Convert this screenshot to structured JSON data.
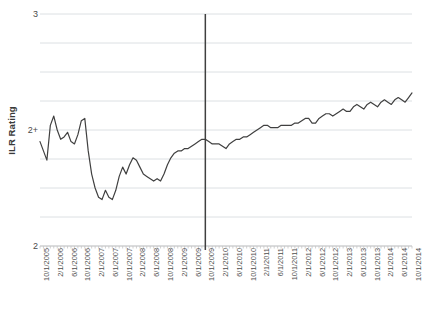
{
  "chart_data": {
    "type": "line",
    "title": "",
    "xlabel": "",
    "ylabel": "ILR Rating",
    "ylim": [
      2,
      3
    ],
    "ytick_labels": [
      "3",
      "2+",
      "2"
    ],
    "ytick_values": [
      3,
      2.6,
      2
    ],
    "gridlines": true,
    "gridline_count": 9,
    "legend": "none",
    "series_name": "ILR Rating",
    "series_color": "#404040",
    "annotations": [
      {
        "type": "vertical-line",
        "x": "10/1/2009",
        "color": "#404040",
        "label": ""
      }
    ],
    "xtick_labels": [
      "10/1/2005",
      "2/1/2006",
      "6/1/2006",
      "10/1/2006",
      "2/1/2007",
      "6/1/2007",
      "10/1/2007",
      "2/1/2008",
      "6/1/2008",
      "10/1/2008",
      "2/1/2009",
      "6/1/2009",
      "10/1/2009",
      "2/1/2010",
      "6/1/2010",
      "10/1/2010",
      "2/1/2011",
      "6/1/2011",
      "10/1/2011",
      "2/1/2012",
      "6/1/2012",
      "10/1/2012",
      "2/1/2013",
      "6/1/2013",
      "10/1/2013",
      "2/1/2014",
      "6/1/2014",
      "10/1/2014"
    ],
    "xtick_label_interval_months": 4,
    "x_start": "10/1/2005",
    "x_end": "10/1/2014",
    "x_step_months": 1,
    "x": [
      "10/1/2005",
      "11/1/2005",
      "12/1/2005",
      "1/1/2006",
      "2/1/2006",
      "3/1/2006",
      "4/1/2006",
      "5/1/2006",
      "6/1/2006",
      "7/1/2006",
      "8/1/2006",
      "9/1/2006",
      "10/1/2006",
      "11/1/2006",
      "12/1/2006",
      "1/1/2007",
      "2/1/2007",
      "3/1/2007",
      "4/1/2007",
      "5/1/2007",
      "6/1/2007",
      "7/1/2007",
      "8/1/2007",
      "9/1/2007",
      "10/1/2007",
      "11/1/2007",
      "12/1/2007",
      "1/1/2008",
      "2/1/2008",
      "3/1/2008",
      "4/1/2008",
      "5/1/2008",
      "6/1/2008",
      "7/1/2008",
      "8/1/2008",
      "9/1/2008",
      "10/1/2008",
      "11/1/2008",
      "12/1/2008",
      "1/1/2009",
      "2/1/2009",
      "3/1/2009",
      "4/1/2009",
      "5/1/2009",
      "6/1/2009",
      "7/1/2009",
      "8/1/2009",
      "9/1/2009",
      "10/1/2009",
      "11/1/2009",
      "12/1/2009",
      "1/1/2010",
      "2/1/2010",
      "3/1/2010",
      "4/1/2010",
      "5/1/2010",
      "6/1/2010",
      "7/1/2010",
      "8/1/2010",
      "9/1/2010",
      "10/1/2010",
      "11/1/2010",
      "12/1/2010",
      "1/1/2011",
      "2/1/2011",
      "3/1/2011",
      "4/1/2011",
      "5/1/2011",
      "6/1/2011",
      "7/1/2011",
      "8/1/2011",
      "9/1/2011",
      "10/1/2011",
      "11/1/2011",
      "12/1/2011",
      "1/1/2012",
      "2/1/2012",
      "3/1/2012",
      "4/1/2012",
      "5/1/2012",
      "6/1/2012",
      "7/1/2012",
      "8/1/2012",
      "9/1/2012",
      "10/1/2012",
      "11/1/2012",
      "12/1/2012",
      "1/1/2013",
      "2/1/2013",
      "3/1/2013",
      "4/1/2013",
      "5/1/2013",
      "6/1/2013",
      "7/1/2013",
      "8/1/2013",
      "9/1/2013",
      "10/1/2013",
      "11/1/2013",
      "12/1/2013",
      "1/1/2014",
      "2/1/2014",
      "3/1/2014",
      "4/1/2014",
      "5/1/2014",
      "6/1/2014",
      "7/1/2014",
      "8/1/2014",
      "9/1/2014",
      "10/1/2014"
    ],
    "values": [
      2.45,
      2.41,
      2.37,
      2.52,
      2.56,
      2.5,
      2.46,
      2.47,
      2.49,
      2.45,
      2.44,
      2.48,
      2.54,
      2.55,
      2.41,
      2.31,
      2.25,
      2.21,
      2.2,
      2.24,
      2.21,
      2.2,
      2.24,
      2.3,
      2.34,
      2.31,
      2.35,
      2.38,
      2.37,
      2.34,
      2.31,
      2.3,
      2.29,
      2.28,
      2.29,
      2.28,
      2.31,
      2.35,
      2.38,
      2.4,
      2.41,
      2.41,
      2.42,
      2.42,
      2.43,
      2.44,
      2.45,
      2.46,
      2.46,
      2.45,
      2.44,
      2.44,
      2.44,
      2.43,
      2.42,
      2.44,
      2.45,
      2.46,
      2.46,
      2.47,
      2.47,
      2.48,
      2.49,
      2.5,
      2.51,
      2.52,
      2.52,
      2.51,
      2.51,
      2.51,
      2.52,
      2.52,
      2.52,
      2.52,
      2.53,
      2.53,
      2.54,
      2.55,
      2.55,
      2.53,
      2.53,
      2.55,
      2.56,
      2.57,
      2.57,
      2.56,
      2.57,
      2.58,
      2.59,
      2.58,
      2.58,
      2.6,
      2.61,
      2.6,
      2.59,
      2.61,
      2.62,
      2.61,
      2.6,
      2.62,
      2.63,
      2.62,
      2.61,
      2.63,
      2.64,
      2.63,
      2.62,
      2.64,
      2.66
    ]
  }
}
